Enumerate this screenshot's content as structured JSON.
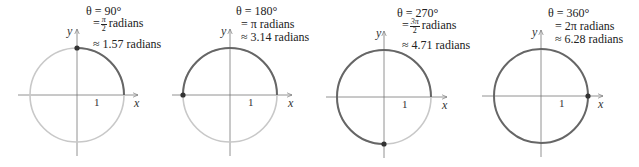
{
  "panels": [
    {
      "theta_label": "θ = 90°",
      "rad_line": "= π/2 radians",
      "rad_num": "π",
      "rad_den": "2",
      "rad_prefix": "=",
      "rad_suffix": "radians",
      "approx_line": "≈ 1.57 radians",
      "x_axis_label": "x",
      "y_axis_label": "y",
      "unit_tick_label": "1",
      "angle_degrees": 90
    },
    {
      "theta_label": "θ = 180°",
      "rad_line": "= π radians",
      "approx_line": "≈ 3.14 radians",
      "x_axis_label": "x",
      "y_axis_label": "y",
      "unit_tick_label": "1",
      "angle_degrees": 180
    },
    {
      "theta_label": "θ = 270°",
      "rad_line": "= 3π/2 radians",
      "rad_num": "3π",
      "rad_den": "2",
      "rad_prefix": "=",
      "rad_suffix": "radians",
      "approx_line": "≈ 4.71 radians",
      "x_axis_label": "x",
      "y_axis_label": "y",
      "unit_tick_label": "1",
      "angle_degrees": 270
    },
    {
      "theta_label": "θ = 360°",
      "rad_line": "= 2π radians",
      "approx_line": "≈ 6.28 radians",
      "x_axis_label": "x",
      "y_axis_label": "y",
      "unit_tick_label": "1",
      "angle_degrees": 360
    }
  ],
  "colors": {
    "swept_arc": "#666666",
    "unswept_arc": "#c8c8c8",
    "axes": "#777777",
    "point": "#333333"
  }
}
